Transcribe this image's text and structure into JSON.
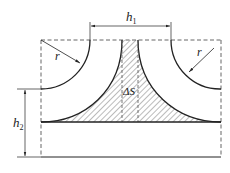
{
  "diagram": {
    "labels": {
      "h1": "h",
      "h1_sub": "1",
      "h2": "h",
      "h2_sub": "2",
      "r_left": "r",
      "r_right": "r",
      "delta_s": "ΔS"
    },
    "colors": {
      "stroke": "#222222",
      "dashed": "#555555",
      "hatch": "#444444",
      "background": "#ffffff"
    }
  }
}
